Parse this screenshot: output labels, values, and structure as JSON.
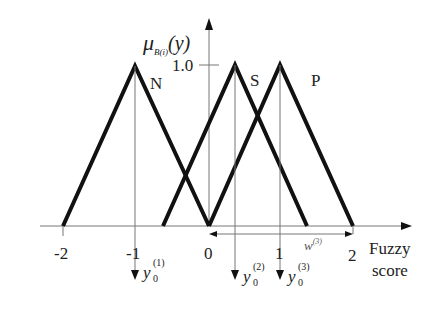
{
  "diagram": {
    "y_axis_label": "μ",
    "y_axis_label_sub": "B(i)",
    "y_axis_label_arg": "(y)",
    "y_tick": "1.0",
    "x_axis_label_line1": "Fuzzy",
    "x_axis_label_line2": "score",
    "x_ticks": [
      "-2",
      "-1",
      "0",
      "1",
      "2"
    ],
    "sets": [
      {
        "name": "N",
        "left": -2,
        "peak": -1,
        "right": 0
      },
      {
        "name": "S",
        "left": -0.35,
        "peak": 0.35,
        "right": 1.35
      },
      {
        "name": "P",
        "left": 0,
        "peak": 1,
        "right": 2
      }
    ],
    "outputs": [
      {
        "symbol": "y",
        "sub": "0",
        "sup": "(1)"
      },
      {
        "symbol": "y",
        "sub": "0",
        "sup": "(2)"
      },
      {
        "symbol": "y",
        "sub": "0",
        "sup": "(3)"
      }
    ],
    "width_label": "w",
    "width_label_sup": "(3)",
    "line_color": "#111111",
    "axis_color": "#555555"
  }
}
